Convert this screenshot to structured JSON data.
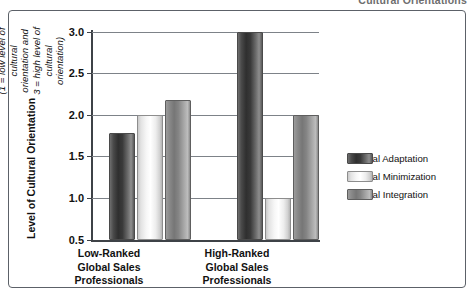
{
  "page_header": {
    "text": "Cultural Orientations"
  },
  "chart_data": {
    "type": "bar",
    "title": "",
    "subtitle": "",
    "xlabel": "",
    "ylabel_main": "Level of Cultural Orientation",
    "ylabel_sub": "(1 = low level of cultural orientation and\n3 = high level of cultural orientation)",
    "categories": [
      "Low-Ranked\nGlobal Sales\nProfessionals",
      "High-Ranked\nGlobal Sales\nProfessionals"
    ],
    "series": [
      {
        "name": "Cultural Adaptation",
        "color": "#3a3a3a",
        "values": [
          1.79,
          3.0
        ]
      },
      {
        "name": "Cultural Minimization",
        "color": "#f0f0f0",
        "values": [
          2.0,
          1.0
        ]
      },
      {
        "name": "Cultural Integration",
        "color": "#8a8a8a",
        "values": [
          2.18,
          2.0
        ]
      }
    ],
    "ylim": [
      0.5,
      3.0
    ],
    "ytick_labels": [
      "3.0",
      "2.5",
      "2.0",
      "1.5",
      "1.0",
      "0.5"
    ],
    "ytick_values": [
      3.0,
      2.5,
      2.0,
      1.5,
      1.0,
      0.5
    ],
    "grid": true,
    "legend_position": "right"
  }
}
